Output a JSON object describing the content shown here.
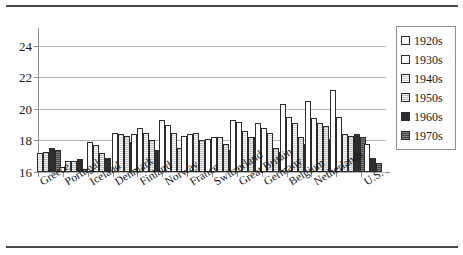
{
  "chart_data": {
    "type": "bar",
    "title": "",
    "subtitle": "",
    "xlabel": "",
    "ylabel": "",
    "ylim": [
      16,
      25
    ],
    "yticks": [
      16,
      18,
      20,
      22,
      24
    ],
    "ytick_labels": [
      "16",
      "18",
      "20",
      "22",
      "24"
    ],
    "grid": true,
    "legend_position": "right",
    "categories": [
      "Greece",
      "Portugal",
      "Iceland",
      "Denmark",
      "Finland",
      "Norway",
      "France",
      "Switzerland",
      "Great Britain",
      "Germany",
      "Belgium",
      "Netherlands",
      "U.S."
    ],
    "series": [
      {
        "name": "1920s",
        "color": "#ffffff",
        "values": [
          null,
          null,
          null,
          null,
          18.4,
          19.3,
          18.3,
          18.1,
          19.3,
          19.1,
          20.3,
          20.5,
          21.2
        ]
      },
      {
        "name": "1930s",
        "color": "#ffffff",
        "values": [
          null,
          16.3,
          17.9,
          18.5,
          18.8,
          19.0,
          18.4,
          18.2,
          19.2,
          18.8,
          19.5,
          19.4,
          19.5
        ]
      },
      {
        "name": "1940s",
        "color": "#d2d2d2",
        "values": [
          17.2,
          16.7,
          17.7,
          18.4,
          18.5,
          18.5,
          18.5,
          18.2,
          18.6,
          18.5,
          19.1,
          19.1,
          18.4
        ]
      },
      {
        "name": "1950s",
        "color": "#c0c0c0",
        "values": [
          17.3,
          16.7,
          17.2,
          18.3,
          18.0,
          17.5,
          18.0,
          17.8,
          18.2,
          17.5,
          18.2,
          18.9,
          18.3
        ]
      },
      {
        "name": "1960s",
        "color": "#2e2e2e",
        "values": [
          17.5,
          16.8,
          16.9,
          17.9,
          17.4,
          18.3,
          17.6,
          17.4,
          18.2,
          17.3,
          17.8,
          18.1,
          18.4
        ]
      },
      {
        "name": "1970s",
        "color": "#4a4a4a",
        "values": [
          17.4,
          16.2,
          null,
          null,
          18.3,
          null,
          17.3,
          17.1,
          18.3,
          17.7,
          17.5,
          17.6,
          18.2
        ]
      }
    ],
    "group_values": [
      {
        "category": "Greece",
        "bars": [
          {
            "series": "1940s",
            "value": 17.2
          },
          {
            "series": "1950s",
            "value": 17.3
          },
          {
            "series": "1960s",
            "value": 17.5
          },
          {
            "series": "1970s",
            "value": 17.4
          }
        ]
      },
      {
        "category": "Portugal",
        "bars": [
          {
            "series": "1930s",
            "value": 16.3
          },
          {
            "series": "1940s",
            "value": 16.7
          },
          {
            "series": "1950s",
            "value": 16.7
          },
          {
            "series": "1960s",
            "value": 16.8
          },
          {
            "series": "1970s",
            "value": 16.2
          }
        ]
      },
      {
        "category": "Iceland",
        "bars": [
          {
            "series": "1930s",
            "value": 17.9
          },
          {
            "series": "1940s",
            "value": 17.7
          },
          {
            "series": "1950s",
            "value": 17.2
          },
          {
            "series": "1960s",
            "value": 16.9
          }
        ]
      },
      {
        "category": "Denmark",
        "bars": [
          {
            "series": "1930s",
            "value": 18.5
          },
          {
            "series": "1940s",
            "value": 18.4
          },
          {
            "series": "1950s",
            "value": 18.3
          },
          {
            "series": "1960s",
            "value": 17.9
          }
        ]
      },
      {
        "category": "Finland",
        "bars": [
          {
            "series": "1920s",
            "value": 18.4
          },
          {
            "series": "1930s",
            "value": 18.8
          },
          {
            "series": "1940s",
            "value": 18.5
          },
          {
            "series": "1950s",
            "value": 18.0
          },
          {
            "series": "1960s",
            "value": 17.4
          },
          {
            "series": "1970s",
            "value": 18.3
          }
        ]
      },
      {
        "category": "Norway",
        "bars": [
          {
            "series": "1920s",
            "value": 19.3
          },
          {
            "series": "1930s",
            "value": 19.0
          },
          {
            "series": "1940s",
            "value": 18.5
          },
          {
            "series": "1950s",
            "value": 17.5
          },
          {
            "series": "1960s",
            "value": 18.3
          }
        ]
      },
      {
        "category": "France",
        "bars": [
          {
            "series": "1920s",
            "value": 18.3
          },
          {
            "series": "1930s",
            "value": 18.4
          },
          {
            "series": "1940s",
            "value": 18.5
          },
          {
            "series": "1950s",
            "value": 18.0
          },
          {
            "series": "1960s",
            "value": 17.6
          },
          {
            "series": "1970s",
            "value": 17.3
          }
        ]
      },
      {
        "category": "Switzerland",
        "bars": [
          {
            "series": "1920s",
            "value": 18.1
          },
          {
            "series": "1930s",
            "value": 18.2
          },
          {
            "series": "1940s",
            "value": 18.2
          },
          {
            "series": "1950s",
            "value": 17.8
          },
          {
            "series": "1960s",
            "value": 17.4
          },
          {
            "series": "1970s",
            "value": 17.1
          }
        ]
      },
      {
        "category": "Great Britain",
        "bars": [
          {
            "series": "1920s",
            "value": 19.3
          },
          {
            "series": "1930s",
            "value": 19.2
          },
          {
            "series": "1940s",
            "value": 18.6
          },
          {
            "series": "1950s",
            "value": 18.2
          },
          {
            "series": "1960s",
            "value": 18.2
          },
          {
            "series": "1970s",
            "value": 18.3
          }
        ]
      },
      {
        "category": "Germany",
        "bars": [
          {
            "series": "1920s",
            "value": 19.1
          },
          {
            "series": "1930s",
            "value": 18.8
          },
          {
            "series": "1940s",
            "value": 18.5
          },
          {
            "series": "1950s",
            "value": 17.5
          },
          {
            "series": "1960s",
            "value": 17.3
          },
          {
            "series": "1970s",
            "value": 17.7
          }
        ]
      },
      {
        "category": "Belgium",
        "bars": [
          {
            "series": "1920s",
            "value": 20.3
          },
          {
            "series": "1930s",
            "value": 19.5
          },
          {
            "series": "1940s",
            "value": 19.1
          },
          {
            "series": "1950s",
            "value": 18.2
          },
          {
            "series": "1960s",
            "value": 17.8
          },
          {
            "series": "1970s",
            "value": 17.5
          }
        ]
      },
      {
        "category": "Netherlands",
        "bars": [
          {
            "series": "1920s",
            "value": 20.5
          },
          {
            "series": "1930s",
            "value": 19.4
          },
          {
            "series": "1940s",
            "value": 19.1
          },
          {
            "series": "1950s",
            "value": 18.9
          },
          {
            "series": "1960s",
            "value": 18.1
          },
          {
            "series": "1970s",
            "value": 17.6
          }
        ]
      },
      {
        "category": "Netherlands2",
        "bars": [
          {
            "series": "1920s",
            "value": 21.2
          },
          {
            "series": "1930s",
            "value": 19.5
          },
          {
            "series": "1940s",
            "value": 18.4
          },
          {
            "series": "1950s",
            "value": 18.3
          },
          {
            "series": "1960s",
            "value": 18.4
          },
          {
            "series": "1970s",
            "value": 18.2
          }
        ]
      },
      {
        "category": "U.S.",
        "bars": [
          {
            "series": "1930s",
            "value": 17.8
          },
          {
            "series": "1960s",
            "value": 16.9
          },
          {
            "series": "1970s",
            "value": 16.6
          }
        ]
      }
    ]
  },
  "legend": {
    "items": [
      {
        "label": "1920s",
        "key": "1920s"
      },
      {
        "label": "1930s",
        "key": "1930s"
      },
      {
        "label": "1940s",
        "key": "1940s"
      },
      {
        "label": "1950s",
        "key": "1950s"
      },
      {
        "label": "1960s",
        "key": "1960s"
      },
      {
        "label": "1970s",
        "key": "1970s"
      }
    ]
  }
}
